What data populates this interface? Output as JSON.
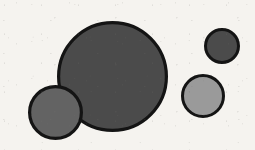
{
  "figure": {
    "width": 255,
    "height": 150,
    "background_color": "#f5f3ef",
    "outline_color": "#141414",
    "texture": "scanned-paper-grain"
  },
  "chart_data": {
    "type": "scatter",
    "subtitle": "",
    "xlabel": "",
    "ylabel": "",
    "xlim": [
      0,
      255
    ],
    "ylim": [
      0,
      150
    ],
    "grid": false,
    "legend": "none",
    "annotations": [],
    "tick_labels": {
      "x": [],
      "y": []
    },
    "series": [
      {
        "name": "circles",
        "marker": "circle",
        "points": [
          {
            "id": "large-dark-circle",
            "label": "large dark circle",
            "cx": 112.5,
            "cy": 76.5,
            "r": 55.5,
            "diameter": 111,
            "fill": "#4b4b4b",
            "stroke": "#141414",
            "stroke_width": 3.2,
            "z": 1
          },
          {
            "id": "small-dark-circle",
            "label": "small dark circle top right",
            "cx": 222,
            "cy": 46,
            "r": 18,
            "diameter": 36,
            "fill": "#4b4b4b",
            "stroke": "#141414",
            "stroke_width": 3.0,
            "z": 2
          },
          {
            "id": "light-gray-circle",
            "label": "light gray circle right",
            "cx": 203,
            "cy": 96,
            "r": 22,
            "diameter": 44,
            "fill": "#9a9a9a",
            "stroke": "#141414",
            "stroke_width": 3.0,
            "z": 3
          },
          {
            "id": "medium-gray-circle",
            "label": "medium gray circle bottom left",
            "cx": 55.5,
            "cy": 112.5,
            "r": 27.5,
            "diameter": 55,
            "fill": "#636363",
            "stroke": "#141414",
            "stroke_width": 3.2,
            "z": 4
          }
        ]
      }
    ]
  }
}
